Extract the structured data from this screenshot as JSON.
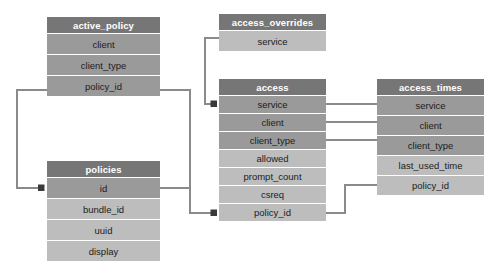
{
  "diagram": {
    "type": "entity-relationship-diagram",
    "title": "",
    "colors": {
      "header_bg": "#767676",
      "header_text": "#ffffff",
      "key_row_bg": "#9a9a9a",
      "attribute_row_bg": "#bdbdbd",
      "row_text": "#1c1c1c",
      "connector": "#8a8a8a",
      "page_bg": "#ffffff"
    },
    "tables": [
      {
        "id": "active_policy",
        "name": "active_policy",
        "x": 47,
        "y": 17,
        "width": 113,
        "header_height": 16,
        "row_height": 21,
        "rows": [
          {
            "name": "client",
            "kind": "key"
          },
          {
            "name": "client_type",
            "kind": "key"
          },
          {
            "name": "policy_id",
            "kind": "key"
          }
        ]
      },
      {
        "id": "access_overrides",
        "name": "access_overrides",
        "x": 219,
        "y": 14,
        "width": 107,
        "header_height": 16,
        "row_height": 21,
        "rows": [
          {
            "name": "service",
            "kind": "attr"
          }
        ]
      },
      {
        "id": "access",
        "name": "access",
        "x": 219,
        "y": 79,
        "width": 107,
        "header_height": 16,
        "row_height": 18,
        "rows": [
          {
            "name": "service",
            "kind": "key"
          },
          {
            "name": "client",
            "kind": "key"
          },
          {
            "name": "client_type",
            "kind": "key"
          },
          {
            "name": "allowed",
            "kind": "attr"
          },
          {
            "name": "prompt_count",
            "kind": "attr"
          },
          {
            "name": "csreq",
            "kind": "attr"
          },
          {
            "name": "policy_id",
            "kind": "attr"
          }
        ]
      },
      {
        "id": "access_times",
        "name": "access_times",
        "x": 377,
        "y": 79,
        "width": 107,
        "header_height": 16,
        "row_height": 20,
        "rows": [
          {
            "name": "service",
            "kind": "key"
          },
          {
            "name": "client",
            "kind": "key"
          },
          {
            "name": "client_type",
            "kind": "key"
          },
          {
            "name": "last_used_time",
            "kind": "attr"
          },
          {
            "name": "policy_id",
            "kind": "attr"
          }
        ]
      },
      {
        "id": "policies",
        "name": "policies",
        "x": 47,
        "y": 161,
        "width": 113,
        "header_height": 16,
        "row_height": 21,
        "rows": [
          {
            "name": "id",
            "kind": "key"
          },
          {
            "name": "bundle_id",
            "kind": "attr"
          },
          {
            "name": "uuid",
            "kind": "attr"
          },
          {
            "name": "display",
            "kind": "attr"
          }
        ]
      }
    ],
    "relationships": [
      {
        "id": "active-policy-to-policies",
        "from": "active_policy.policy_id",
        "to": "policies.id"
      },
      {
        "id": "active-policy-to-access",
        "from": "active_policy.policy_id",
        "to": "access.policy_id"
      },
      {
        "id": "policies-to-access",
        "from": "policies.id",
        "to": "access.policy_id"
      },
      {
        "id": "overrides-to-access",
        "from": "access_overrides.service",
        "to": "access.service"
      },
      {
        "id": "access-service-to-times",
        "from": "access.service",
        "to": "access_times.service"
      },
      {
        "id": "access-client-to-times",
        "from": "access.client",
        "to": "access_times.client"
      },
      {
        "id": "access-type-to-times",
        "from": "access.client_type",
        "to": "access_times.client_type"
      },
      {
        "id": "times-policy-to-access",
        "from": "access_times.policy_id",
        "to": "access.policy_id"
      }
    ]
  }
}
